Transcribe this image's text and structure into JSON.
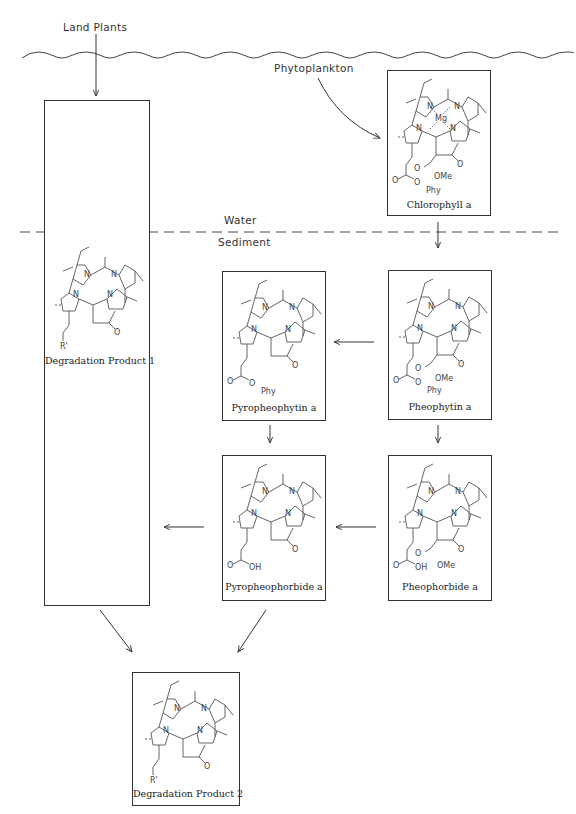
{
  "diagram": {
    "sources": {
      "land_plants": "Land  Plants",
      "phytoplankton": "Phytoplankton"
    },
    "zones": {
      "water": "Water",
      "sediment": "Sediment"
    },
    "compounds": [
      {
        "id": "chlorophyll_a",
        "label": "Chlorophyll a",
        "substituents": {
          "metal": "Mg",
          "ester_c13": "OMe",
          "ester_c17": "Phy"
        }
      },
      {
        "id": "pheophytin_a",
        "label": "Pheophytin a",
        "substituents": {
          "ester_c13": "OMe",
          "ester_c17": "Phy"
        }
      },
      {
        "id": "pyropheophytin_a",
        "label": "Pyropheophytin a",
        "substituents": {
          "ester_c17": "Phy"
        }
      },
      {
        "id": "pheophorbide_a",
        "label": "Pheophorbide a",
        "substituents": {
          "ester_c13": "OMe",
          "acid_c17": "OH"
        }
      },
      {
        "id": "pyropheophorbide_a",
        "label": "Pyropheophorbide a",
        "substituents": {
          "acid_c17": "OH"
        }
      },
      {
        "id": "degradation_product_1",
        "label": "Degradation Product 1",
        "substituents": {
          "side_chain": "R'"
        }
      },
      {
        "id": "degradation_product_2",
        "label": "Degradation Product 2",
        "substituents": {
          "side_chain": "R'"
        }
      }
    ],
    "atoms": {
      "N": "N",
      "O": "O",
      "Mg": "Mg",
      "OMe": "OMe",
      "Phy": "Phy",
      "OH": "OH",
      "R": "R'"
    },
    "edges": [
      {
        "from": "land_plants",
        "to": "degradation_product_1"
      },
      {
        "from": "phytoplankton",
        "to": "chlorophyll_a"
      },
      {
        "from": "chlorophyll_a",
        "to": "pheophytin_a"
      },
      {
        "from": "pheophytin_a",
        "to": "pyropheophytin_a"
      },
      {
        "from": "pheophytin_a",
        "to": "pheophorbide_a"
      },
      {
        "from": "pyropheophytin_a",
        "to": "pyropheophorbide_a"
      },
      {
        "from": "pheophorbide_a",
        "to": "pyropheophorbide_a"
      },
      {
        "from": "pyropheophorbide_a",
        "to": "degradation_product_1"
      },
      {
        "from": "degradation_product_1",
        "to": "degradation_product_2"
      },
      {
        "from": "pyropheophorbide_a",
        "to": "degradation_product_2"
      }
    ]
  }
}
